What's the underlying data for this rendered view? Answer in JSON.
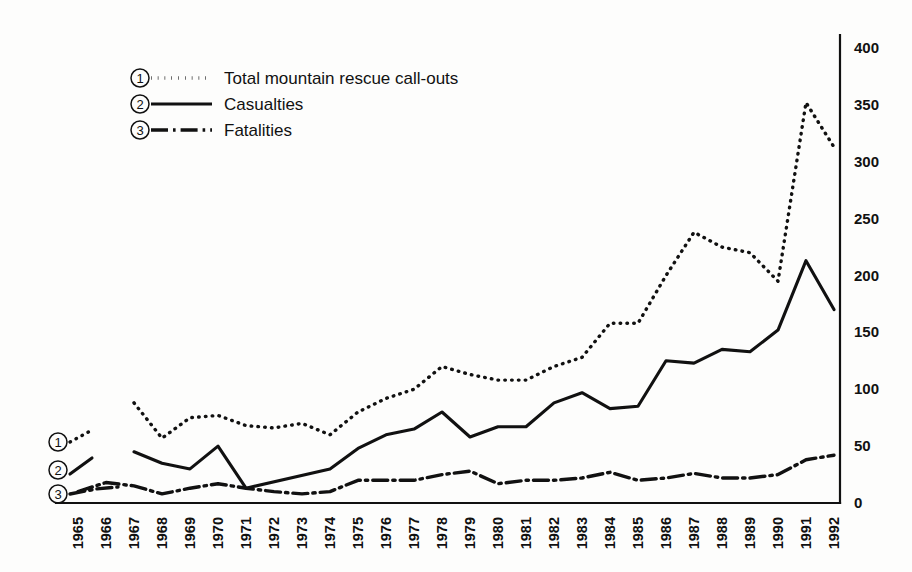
{
  "chart_data": {
    "type": "line",
    "title": "",
    "xlabel": "",
    "ylabel": "",
    "grid": false,
    "legend_position": "top-left",
    "ylim": [
      0,
      400
    ],
    "yticks": [
      0,
      50,
      100,
      150,
      200,
      250,
      300,
      350,
      400
    ],
    "ytick_labels": [
      "0",
      "50",
      "100",
      "150",
      "200",
      "250",
      "300",
      "350",
      "400"
    ],
    "y_axis_side": "right",
    "categories": [
      "1965",
      "1966",
      "1967",
      "1968",
      "1969",
      "1970",
      "1971",
      "1972",
      "1973",
      "1974",
      "1975",
      "1976",
      "1977",
      "1978",
      "1979",
      "1980",
      "1981",
      "1982",
      "1983",
      "1984",
      "1985",
      "1986",
      "1987",
      "1988",
      "1989",
      "1990",
      "1991",
      "1992"
    ],
    "series": [
      {
        "key": "callouts",
        "marker": "1",
        "name": "Total mountain rescue call-outs",
        "style": "dotted",
        "x": [
          "1967",
          "1968",
          "1969",
          "1970",
          "1971",
          "1972",
          "1973",
          "1974",
          "1975",
          "1976",
          "1977",
          "1978",
          "1979",
          "1980",
          "1981",
          "1982",
          "1983",
          "1984",
          "1985",
          "1986",
          "1987",
          "1988",
          "1989",
          "1990",
          "1991",
          "1992"
        ],
        "values": [
          88,
          57,
          75,
          77,
          68,
          66,
          70,
          60,
          80,
          92,
          100,
          120,
          113,
          108,
          108,
          120,
          128,
          158,
          158,
          200,
          238,
          225,
          220,
          195,
          352,
          313
        ]
      },
      {
        "key": "casualties",
        "marker": "2",
        "name": "Casualties",
        "style": "solid",
        "x": [
          "1967",
          "1968",
          "1969",
          "1970",
          "1971",
          "1974",
          "1975",
          "1976",
          "1977",
          "1978",
          "1979",
          "1980",
          "1981",
          "1982",
          "1983",
          "1984",
          "1985",
          "1986",
          "1987",
          "1988",
          "1989",
          "1990",
          "1991",
          "1992"
        ],
        "values": [
          45,
          35,
          30,
          50,
          13,
          30,
          48,
          60,
          65,
          80,
          58,
          67,
          67,
          88,
          97,
          83,
          85,
          125,
          123,
          135,
          133,
          152,
          213,
          170
        ]
      },
      {
        "key": "fatalities",
        "marker": "3",
        "name": "Fatalities",
        "style": "dash-dot",
        "x": [
          "1965",
          "1966",
          "1967",
          "1968",
          "1969",
          "1970",
          "1971",
          "1972",
          "1973",
          "1974",
          "1975",
          "1976",
          "1977",
          "1978",
          "1979",
          "1980",
          "1981",
          "1982",
          "1983",
          "1984",
          "1985",
          "1986",
          "1987",
          "1988",
          "1989",
          "1990",
          "1991",
          "1992"
        ],
        "values": [
          10,
          18,
          15,
          8,
          13,
          17,
          13,
          10,
          8,
          10,
          20,
          20,
          20,
          25,
          28,
          17,
          20,
          20,
          22,
          27,
          20,
          22,
          26,
          22,
          22,
          25,
          38,
          42
        ]
      }
    ]
  },
  "legend": {
    "items": [
      {
        "marker": "1",
        "label": "Total mountain rescue call-outs",
        "style": "dotted"
      },
      {
        "marker": "2",
        "label": "Casualties",
        "style": "solid"
      },
      {
        "marker": "3",
        "label": "Fatalities",
        "style": "dash-dot"
      }
    ]
  },
  "inline_markers": [
    {
      "marker": "1",
      "series": "callouts"
    },
    {
      "marker": "2",
      "series": "casualties"
    },
    {
      "marker": "3",
      "series": "fatalities"
    }
  ],
  "colors": {
    "ink": "#111111",
    "background": "#fdfdfc"
  }
}
